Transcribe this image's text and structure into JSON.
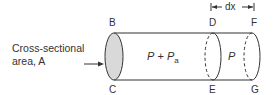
{
  "diagram": {
    "side_label": {
      "line1": "Cross-sectional",
      "line2": "area, A"
    },
    "points": {
      "B": "B",
      "C": "C",
      "D": "D",
      "E": "E",
      "F": "F",
      "G": "G"
    },
    "dimension": {
      "symbol": "dx"
    },
    "regions": {
      "left_pressure_main": "P",
      "left_pressure_op": "+",
      "left_pressure_sub_base": "P",
      "left_pressure_sub": "a",
      "right_pressure": "P"
    },
    "colors": {
      "stroke": "#333333",
      "fill_section": "#d9d9d9",
      "text": "#333333"
    }
  }
}
